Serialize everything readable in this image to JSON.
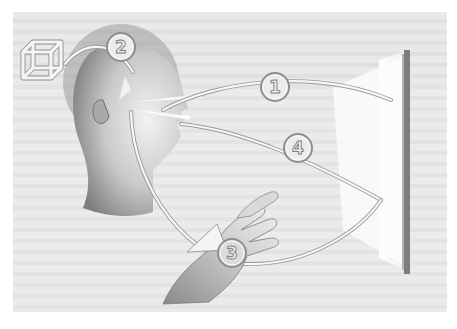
{
  "figure": {
    "colors": {
      "background": "#ffffff",
      "panel": "#e9e9e9",
      "skin_dark": "#8f8f8f",
      "skin_light": "#d8d8d8",
      "arc": "#f7f7f7",
      "arc_outline": "#9a9a9a",
      "screen_edge": "#7d7d7d",
      "screen_face": "#fbfbfb"
    },
    "labels": [
      {
        "id": "1",
        "text": "1"
      },
      {
        "id": "2",
        "text": "2"
      },
      {
        "id": "3",
        "text": "3"
      },
      {
        "id": "4",
        "text": "4"
      }
    ],
    "icons": {
      "cube": "cube-wireframe-icon"
    }
  }
}
